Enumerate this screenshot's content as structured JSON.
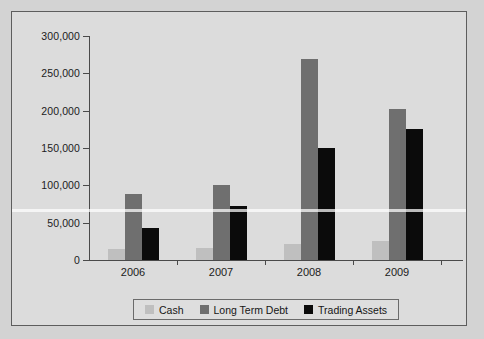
{
  "chart_data": {
    "type": "bar",
    "title": "",
    "xlabel": "",
    "ylabel": "",
    "categories": [
      "2006",
      "2007",
      "2008",
      "2009"
    ],
    "series": [
      {
        "name": "Cash",
        "color": "#bfbfbf",
        "values": [
          15000,
          16000,
          21000,
          25000
        ]
      },
      {
        "name": "Long Term Debt",
        "color": "#6f6f6f",
        "values": [
          89000,
          100000,
          269000,
          202000
        ]
      },
      {
        "name": "Trading Assets",
        "color": "#0b0b0b",
        "values": [
          43000,
          72000,
          150000,
          176000
        ]
      }
    ],
    "ylim": [
      0,
      300000
    ],
    "y_ticks": [
      0,
      50000,
      100000,
      150000,
      200000,
      250000,
      300000
    ],
    "y_tick_labels": [
      "0",
      "50,000",
      "100,000",
      "150,000",
      "200,000",
      "250,000",
      "300,000"
    ],
    "grid": false,
    "legend_position": "bottom",
    "legend": [
      "Cash",
      "Long Term Debt",
      "Trading Assets"
    ]
  },
  "figure": {
    "background_color": "#dcdcdc",
    "page_color": "#d3d3d3",
    "border_color": "#5d5d5d",
    "axis_color": "#4a4a4a",
    "text_color": "#1b1b1b"
  }
}
